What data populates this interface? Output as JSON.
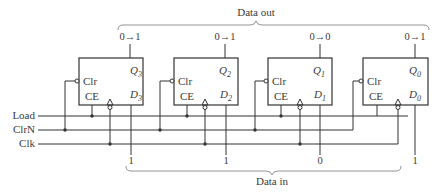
{
  "data_out": {
    "label": "Data out",
    "transitions": [
      "0→1",
      "0→1",
      "0→0",
      "0→1"
    ]
  },
  "data_in": {
    "label": "Data in",
    "values": [
      "1",
      "1",
      "0",
      "1"
    ]
  },
  "signals": {
    "load": "Load",
    "clrn": "ClrN",
    "clk": "Clk"
  },
  "flipflops": [
    {
      "clr": "Clr",
      "ce": "CE",
      "q": "Q",
      "q_sub": "3",
      "d": "D",
      "d_sub": "3"
    },
    {
      "clr": "Clr",
      "ce": "CE",
      "q": "Q",
      "q_sub": "2",
      "d": "D",
      "d_sub": "2"
    },
    {
      "clr": "Clr",
      "ce": "CE",
      "q": "Q",
      "q_sub": "1",
      "d": "D",
      "d_sub": "1"
    },
    {
      "clr": "Clr",
      "ce": "CE",
      "q": "Q",
      "q_sub": "0",
      "d": "D",
      "d_sub": "0"
    }
  ],
  "colors": {
    "line": "#333333",
    "text": "#3a3a3a",
    "brace": "#888888"
  }
}
